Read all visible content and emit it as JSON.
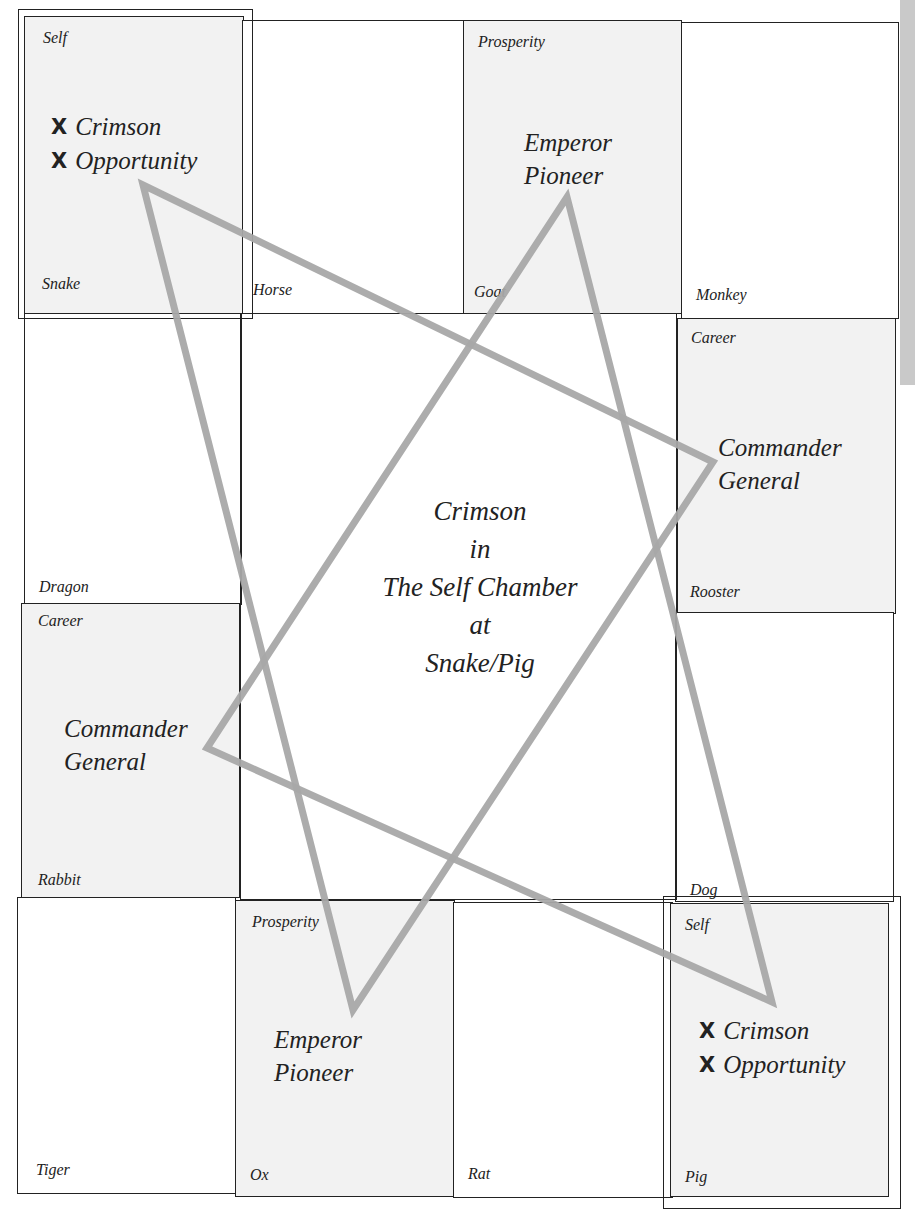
{
  "center": {
    "lines": [
      "Crimson",
      "in",
      "The Self Chamber",
      "at",
      "Snake/Pig"
    ]
  },
  "cells": {
    "snake": {
      "branch": "Snake",
      "chamber": "Self",
      "stars": [
        "Crimson",
        "Opportunity"
      ],
      "marked": true
    },
    "horse": {
      "branch": "Horse",
      "chamber": "",
      "stars": []
    },
    "goat": {
      "branch": "Goat",
      "chamber": "Prosperity",
      "stars": [
        "Emperor",
        "Pioneer"
      ]
    },
    "monkey": {
      "branch": "Monkey",
      "chamber": "",
      "stars": []
    },
    "rooster": {
      "branch": "Rooster",
      "chamber": "Career",
      "stars": [
        "Commander",
        "General"
      ]
    },
    "dog": {
      "branch": "Dog",
      "chamber": "",
      "stars": []
    },
    "pig": {
      "branch": "Pig",
      "chamber": "Self",
      "stars": [
        "Crimson",
        "Opportunity"
      ],
      "marked": true
    },
    "rat": {
      "branch": "Rat",
      "chamber": "",
      "stars": []
    },
    "ox": {
      "branch": "Ox",
      "chamber": "Prosperity",
      "stars": [
        "Emperor",
        "Pioneer"
      ]
    },
    "tiger": {
      "branch": "Tiger",
      "chamber": "",
      "stars": []
    },
    "rabbit": {
      "branch": "Rabbit",
      "chamber": "Career",
      "stars": [
        "Commander",
        "General"
      ]
    },
    "dragon": {
      "branch": "Dragon",
      "chamber": "",
      "stars": []
    }
  },
  "markers": {
    "x": "X"
  },
  "triangles": [
    {
      "name": "snake-rooster-ox",
      "points": [
        [
          143,
          185
        ],
        [
          713,
          462
        ],
        [
          353,
          1010
        ]
      ]
    },
    {
      "name": "goat-pig-rabbit",
      "points": [
        [
          567,
          197
        ],
        [
          772,
          1002
        ],
        [
          207,
          748
        ]
      ]
    }
  ],
  "colors": {
    "line": "#a8a8a8",
    "shaded_cell": "#f2f2f2",
    "border": "#222222"
  }
}
